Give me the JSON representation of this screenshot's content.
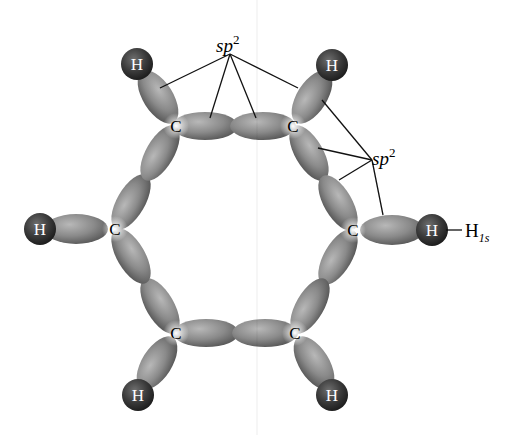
{
  "figure": {
    "colors": {
      "background": "#ffffff",
      "orbital_light": "#b4b4b4",
      "orbital_dark": "#5c5c5c",
      "hydrogen_light": "#6a6a6a",
      "hydrogen_dark": "#232323",
      "label_line": "#111111"
    },
    "atoms": [
      {
        "id": "C1",
        "element": "C",
        "label": "C",
        "x": 176,
        "y": 126
      },
      {
        "id": "C2",
        "element": "C",
        "label": "C",
        "x": 293,
        "y": 126
      },
      {
        "id": "C3",
        "element": "C",
        "label": "C",
        "x": 353,
        "y": 230
      },
      {
        "id": "C4",
        "element": "C",
        "label": "C",
        "x": 295,
        "y": 333
      },
      {
        "id": "C5",
        "element": "C",
        "label": "C",
        "x": 176,
        "y": 333
      },
      {
        "id": "C6",
        "element": "C",
        "label": "C",
        "x": 115,
        "y": 229
      },
      {
        "id": "H1",
        "element": "H",
        "label": "H",
        "x": 137,
        "y": 64
      },
      {
        "id": "H2",
        "element": "H",
        "label": "H",
        "x": 332,
        "y": 65
      },
      {
        "id": "H3",
        "element": "H",
        "label": "H",
        "x": 432,
        "y": 230
      },
      {
        "id": "H4",
        "element": "H",
        "label": "H",
        "x": 332,
        "y": 395
      },
      {
        "id": "H5",
        "element": "H",
        "label": "H",
        "x": 138,
        "y": 395
      },
      {
        "id": "H6",
        "element": "H",
        "label": "H",
        "x": 40,
        "y": 229
      }
    ],
    "annotations": {
      "top_sp2": {
        "text": "sp",
        "sup": "2",
        "x": 216,
        "y": 52
      },
      "right_sp2": {
        "text": "sp",
        "sup": "2",
        "x": 372,
        "y": 165
      },
      "h1s": {
        "text": "H",
        "sub": "1s",
        "x": 460,
        "y": 237
      }
    }
  }
}
